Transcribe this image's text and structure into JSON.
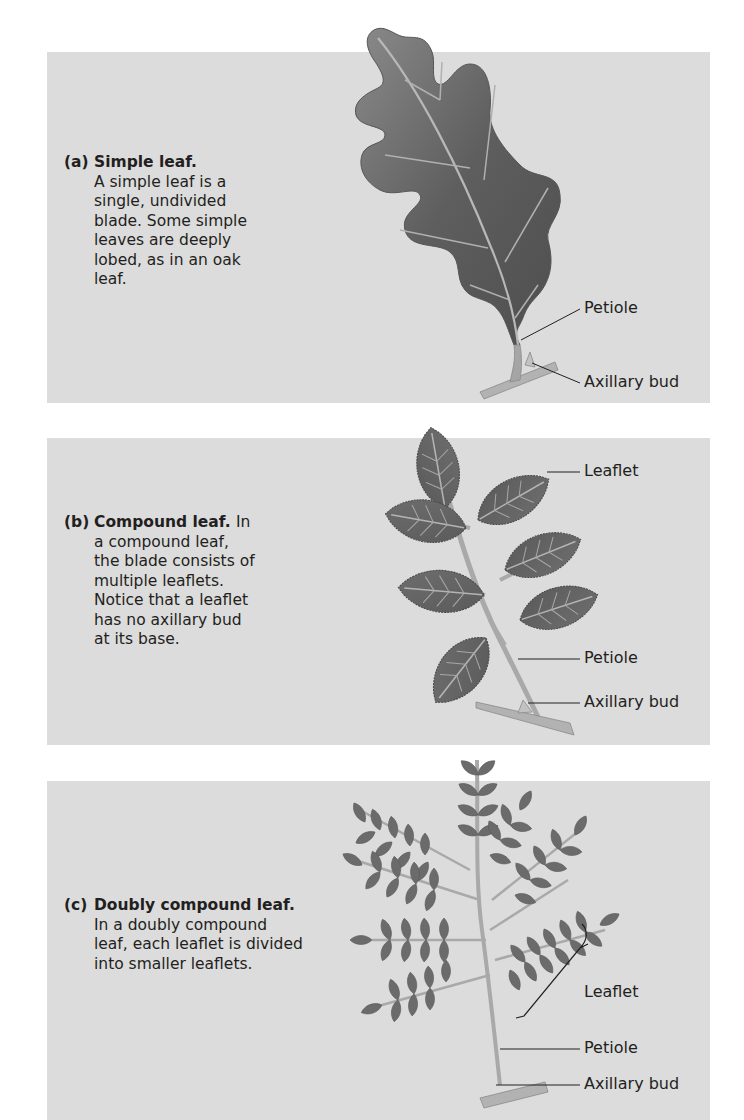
{
  "figure": {
    "panels": [
      {
        "id": "a",
        "letter": "(a)",
        "title": "Simple leaf.",
        "description_lines": [
          "A simple leaf is a",
          "single, undivided",
          "blade. Some simple",
          "leaves are deeply",
          "lobed, as in an oak",
          "leaf."
        ],
        "labels": [
          "Petiole",
          "Axillary bud"
        ]
      },
      {
        "id": "b",
        "letter": "(b)",
        "title": "Compound leaf.",
        "title_trailing": "In",
        "description_lines": [
          "a compound leaf,",
          "the blade consists of",
          "multiple leaflets.",
          "Notice that a leaflet",
          "has no axillary bud",
          "at its base."
        ],
        "labels": [
          "Leaflet",
          "Petiole",
          "Axillary bud"
        ]
      },
      {
        "id": "c",
        "letter": "(c)",
        "title": "Doubly compound leaf.",
        "description_lines": [
          "In a doubly compound",
          "leaf, each leaflet is divided",
          "into smaller leaflets."
        ],
        "labels": [
          "Leaflet",
          "Petiole",
          "Axillary bud"
        ]
      }
    ],
    "colors": {
      "panel_bg": "#dcdcdc",
      "leaf_fill": "#6e6e6e",
      "leaf_dark": "#555555",
      "vein": "#b4b4b4",
      "stem": "#a9a9a9",
      "text": "#231f20"
    }
  }
}
